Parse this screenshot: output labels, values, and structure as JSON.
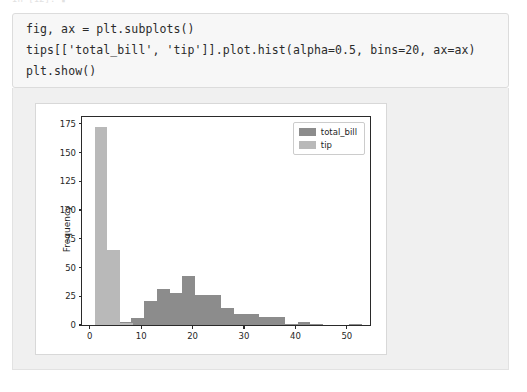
{
  "top_fragment": {
    "text": "In [12]:  ▮"
  },
  "code_cell": {
    "lines": [
      "fig, ax = plt.subplots()",
      "tips[['total_bill', 'tip']].plot.hist(alpha=0.5, bins=20, ax=ax)",
      "plt.show()"
    ]
  },
  "colors": {
    "total_bill": "#8c8c8c",
    "tip": "#b9b9b9",
    "axis": "#2a2a2a",
    "figure_bg": "#ffffff",
    "output_bg": "#f0f0f0",
    "code_bg": "#f7f7f7"
  },
  "chart_data": {
    "type": "bar",
    "subtype": "histogram-overlay",
    "title": "",
    "xlabel": "",
    "ylabel": "Frequency",
    "xlim": [
      -1.5,
      54.5
    ],
    "ylim": [
      0,
      181
    ],
    "xticks": [
      0,
      10,
      20,
      30,
      40,
      50
    ],
    "yticks": [
      0,
      25,
      50,
      75,
      100,
      125,
      150,
      175
    ],
    "grid": false,
    "alpha": 0.5,
    "bins": 20,
    "legend": [
      "total_bill",
      "tip"
    ],
    "legend_position": "upper right",
    "series": [
      {
        "name": "tip",
        "color": "#b9b9b9",
        "bin_edges": [
          1.0,
          3.45,
          5.9,
          8.35
        ],
        "values": [
          172,
          65,
          2
        ]
      },
      {
        "name": "total_bill",
        "color": "#8c8c8c",
        "bin_edges": [
          3.07,
          5.56,
          8.05,
          10.54,
          13.03,
          15.52,
          18.01,
          20.5,
          22.99,
          25.48,
          27.97,
          30.46,
          32.95,
          35.44,
          37.93,
          40.42,
          42.91,
          45.4,
          47.89,
          50.38,
          52.87
        ],
        "values": [
          2,
          3,
          6,
          21,
          31,
          28,
          43,
          26,
          26,
          15,
          10,
          10,
          7,
          7,
          1,
          3,
          1,
          0,
          0,
          1
        ]
      }
    ]
  }
}
